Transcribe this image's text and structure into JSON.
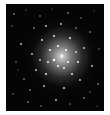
{
  "image": {
    "subject": "globular star cluster",
    "background_color": "#050505",
    "core_color": "#ffffff",
    "frame_color": "#ffffff"
  }
}
